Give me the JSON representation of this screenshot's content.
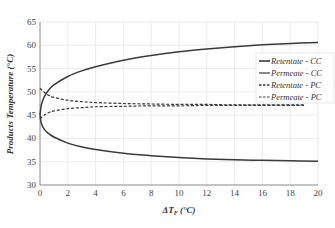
{
  "chart_data": {
    "type": "line",
    "title": "",
    "xlabel": "ΔT_F (°C)",
    "ylabel": "Products Temperature (°C)",
    "xlim": [
      0,
      20
    ],
    "ylim": [
      30,
      65
    ],
    "xticks": [
      0,
      2,
      4,
      6,
      8,
      10,
      12,
      14,
      16,
      18,
      20
    ],
    "yticks": [
      30,
      35,
      40,
      45,
      50,
      55,
      60,
      65
    ],
    "grid": true,
    "legend_position": "right-inside",
    "series": [
      {
        "name": "Retentate - CC",
        "style": "solid",
        "x": [
          0,
          0.1,
          0.3,
          0.6,
          1,
          2,
          3,
          4,
          6,
          8,
          10,
          12,
          14,
          16,
          18,
          20
        ],
        "y": [
          45.0,
          47.2,
          48.9,
          50.3,
          51.5,
          53.3,
          54.5,
          55.4,
          56.8,
          57.8,
          58.6,
          59.2,
          59.7,
          60.1,
          60.4,
          60.6
        ]
      },
      {
        "name": "Permeate - CC",
        "style": "solid",
        "x": [
          0,
          0.1,
          0.3,
          0.6,
          1,
          2,
          3,
          4,
          6,
          8,
          10,
          12,
          14,
          16,
          18,
          20
        ],
        "y": [
          45.0,
          43.2,
          42.0,
          41.1,
          40.3,
          39.0,
          38.2,
          37.6,
          36.8,
          36.3,
          35.9,
          35.6,
          35.4,
          35.3,
          35.2,
          35.1
        ]
      },
      {
        "name": "Retentate - PC",
        "style": "dashed",
        "x": [
          0,
          0.3,
          0.6,
          1,
          2,
          3,
          4,
          6,
          8,
          10,
          12,
          14,
          16,
          19
        ],
        "y": [
          50.8,
          49.9,
          49.3,
          48.8,
          48.2,
          47.9,
          47.7,
          47.5,
          47.4,
          47.3,
          47.3,
          47.2,
          47.2,
          47.2
        ]
      },
      {
        "name": "Permeate - PC",
        "style": "dashed",
        "x": [
          0,
          0.3,
          0.6,
          1,
          2,
          3,
          4,
          6,
          8,
          10,
          12,
          14,
          16,
          19
        ],
        "y": [
          44.2,
          45.0,
          45.5,
          45.9,
          46.4,
          46.6,
          46.8,
          46.9,
          47.0,
          47.0,
          47.1,
          47.1,
          47.1,
          47.1
        ]
      }
    ]
  },
  "axes": {
    "x_title_prefix": "ΔT",
    "x_title_sub": "F",
    "x_title_suffix": " (°C)",
    "y_title": "Products Temperature (°C)"
  },
  "legend": {
    "items": [
      {
        "label": "Retentate - CC",
        "style": "solid"
      },
      {
        "label": "Permeate - CC",
        "style": "solid"
      },
      {
        "label": "Retentate - PC",
        "style": "dashed"
      },
      {
        "label": "Permeate - PC",
        "style": "dashed"
      }
    ]
  },
  "colors": {
    "line": "#3a3a3a",
    "grid": "#e6e6e6",
    "axis": "#888888"
  }
}
